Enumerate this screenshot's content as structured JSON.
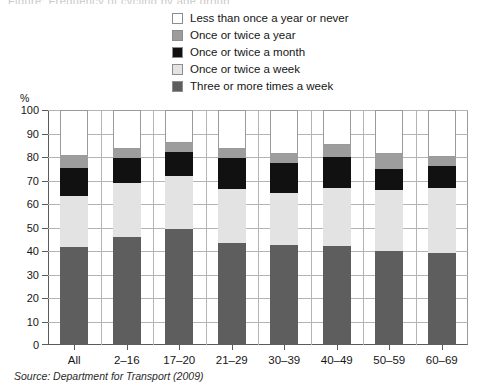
{
  "title_remnant": "Figure: Frequency of cycling by age group",
  "axis": {
    "y_unit": "%",
    "y_ticks": [
      "100",
      "90",
      "80",
      "70",
      "60",
      "50",
      "40",
      "30",
      "20",
      "10",
      "0"
    ]
  },
  "legend": {
    "items": [
      {
        "label": "Less than once a year or never",
        "color": "#ffffff",
        "swatch_name": "swatch-less-than-once-a-year-or-never"
      },
      {
        "label": "Once or twice a year",
        "color": "#9d9d9d",
        "swatch_name": "swatch-once-or-twice-a-year"
      },
      {
        "label": "Once or twice a month",
        "color": "#111111",
        "swatch_name": "swatch-once-or-twice-a-month"
      },
      {
        "label": "Once or twice a week",
        "color": "#e3e3e3",
        "swatch_name": "swatch-once-or-twice-a-week"
      },
      {
        "label": "Three or more times a week",
        "color": "#5e5e5e",
        "swatch_name": "swatch-three-or-more-times-a-week"
      }
    ]
  },
  "source": "Source: Department for Transport (2009)",
  "chart_data": {
    "type": "bar",
    "subtype": "stacked-column",
    "title": "",
    "xlabel": "",
    "ylabel": "%",
    "ylim": [
      0,
      100
    ],
    "ytick_step": 10,
    "grid": true,
    "legend_position": "top",
    "categories": [
      "All",
      "2–16",
      "17–20",
      "21–29",
      "30–39",
      "40–49",
      "50–59",
      "60–69"
    ],
    "series": [
      {
        "name": "Three or more times a week",
        "color": "#5e5e5e",
        "values": [
          41.5,
          46.0,
          49.5,
          43.5,
          42.5,
          42.0,
          40.0,
          39.0
        ]
      },
      {
        "name": "Once or twice a week",
        "color": "#e3e3e3",
        "values": [
          22.0,
          23.0,
          22.5,
          23.0,
          22.0,
          25.0,
          26.0,
          28.0
        ]
      },
      {
        "name": "Once or twice a month",
        "color": "#111111",
        "values": [
          12.0,
          10.5,
          10.0,
          13.0,
          13.0,
          13.0,
          9.0,
          9.0
        ]
      },
      {
        "name": "Once or twice a year",
        "color": "#9d9d9d",
        "values": [
          5.0,
          4.0,
          4.0,
          4.0,
          4.0,
          5.0,
          6.5,
          4.0
        ]
      },
      {
        "name": "Less than once a year or never",
        "color": "#ffffff",
        "values": [
          19.5,
          16.5,
          14.0,
          16.5,
          18.5,
          15.0,
          18.5,
          20.0
        ]
      }
    ],
    "cumulative_tops": [
      [
        41.5,
        63.5,
        75.5,
        80.5,
        100
      ],
      [
        46.0,
        69.0,
        79.5,
        83.5,
        100
      ],
      [
        49.5,
        72.0,
        82.0,
        86.0,
        100
      ],
      [
        43.5,
        66.5,
        79.5,
        83.5,
        100
      ],
      [
        42.5,
        64.5,
        77.5,
        81.5,
        100
      ],
      [
        42.0,
        67.0,
        80.0,
        85.0,
        100
      ],
      [
        40.0,
        66.0,
        75.0,
        81.5,
        100
      ],
      [
        39.0,
        67.0,
        76.0,
        80.0,
        100
      ]
    ]
  }
}
